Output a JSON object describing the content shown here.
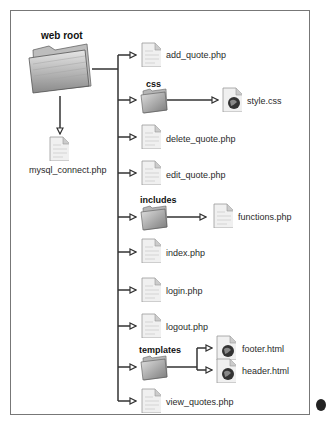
{
  "diagram": {
    "root": {
      "label": "web root"
    },
    "root_child": {
      "label": "mysql_connect.php"
    },
    "items": [
      {
        "type": "file",
        "label": "add_quote.php"
      },
      {
        "type": "folder",
        "label": "css",
        "children": [
          {
            "type": "web-file",
            "label": "style.css"
          }
        ]
      },
      {
        "type": "file",
        "label": "delete_quote.php"
      },
      {
        "type": "file",
        "label": "edit_quote.php"
      },
      {
        "type": "folder",
        "label": "includes",
        "children": [
          {
            "type": "file",
            "label": "functions.php"
          }
        ]
      },
      {
        "type": "file",
        "label": "index.php"
      },
      {
        "type": "file",
        "label": "login.php"
      },
      {
        "type": "file",
        "label": "logout.php"
      },
      {
        "type": "folder",
        "label": "templates",
        "children": [
          {
            "type": "web-file",
            "label": "footer.html"
          },
          {
            "type": "web-file",
            "label": "header.html"
          }
        ]
      },
      {
        "type": "file",
        "label": "view_quotes.php"
      }
    ],
    "colors": {
      "line": "#333333",
      "frame": "#777777",
      "folder": "#9a9a9a",
      "doc": "#eeeeee"
    }
  }
}
